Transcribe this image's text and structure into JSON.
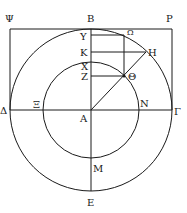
{
  "figure": {
    "type": "geometric-diagram",
    "stroke_color": "#1a1a1a",
    "background": "#ffffff"
  },
  "labels": {
    "psi": "Ψ",
    "beta": "B",
    "rho": "P",
    "upsilon": "Υ",
    "omega": "Ω",
    "kappa": "K",
    "eta": "H",
    "chi": "X",
    "zeta": "Z",
    "theta": "Θ",
    "delta": "Δ",
    "xi": "Ξ",
    "nu": "N",
    "gamma": "Γ",
    "alpha": "A",
    "mu": "M",
    "epsilon": "E"
  }
}
